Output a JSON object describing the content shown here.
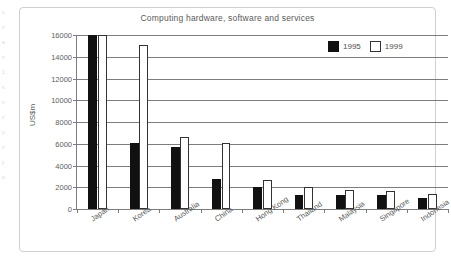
{
  "chart_data": {
    "type": "bar",
    "title": "Computing hardware, software and services",
    "xlabel": "",
    "ylabel": "US$m",
    "ylim": [
      0,
      16000
    ],
    "ytick_values": [
      0,
      2000,
      4000,
      6000,
      8000,
      10000,
      12000,
      14000,
      16000
    ],
    "ytick_labels": [
      "0",
      "2000",
      "4000",
      "6000",
      "8000",
      "10000",
      "12000",
      "14000",
      "16000"
    ],
    "grid": true,
    "legend_position": "top-right",
    "categories": [
      "Japan",
      "Korea",
      "Australia",
      "China",
      "Hong Kong",
      "Thailand",
      "Malaysia",
      "Singapore",
      "Indonesia"
    ],
    "series": [
      {
        "name": "1995",
        "color": "#111111",
        "style": "filled",
        "values": [
          16000,
          6050,
          5700,
          2750,
          2050,
          1250,
          1300,
          1300,
          1050
        ]
      },
      {
        "name": "1999",
        "color": "#ffffff",
        "style": "outline",
        "values": [
          16000,
          15100,
          6600,
          6050,
          2700,
          2050,
          1750,
          1650,
          1350
        ]
      }
    ]
  },
  "legend": {
    "items": [
      {
        "label": "1995",
        "swatch": "filled-black"
      },
      {
        "label": "1999",
        "swatch": "outline-white"
      }
    ]
  },
  "scan_margin": {
    "marks": [
      "c",
      "v",
      "a",
      "n",
      "1",
      "s",
      "n",
      "c",
      "y",
      "v",
      "y",
      "o"
    ]
  }
}
